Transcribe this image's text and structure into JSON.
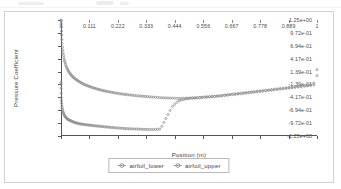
{
  "chart_data": {
    "type": "scatter",
    "title": "",
    "xlabel": "Position (m)",
    "ylabel": "Pressure Coefficient",
    "xlim": [
      0,
      1
    ],
    "ylim": [
      -1.25,
      1.25
    ],
    "grid": false,
    "legend_position": "bottom-center",
    "xticks": [
      "0",
      "0.111",
      "0.222",
      "0.333",
      "0.444",
      "0.556",
      "0.667",
      "0.778",
      "0.889",
      "1"
    ],
    "xtick_values": [
      0,
      0.111,
      0.222,
      0.333,
      0.444,
      0.556,
      0.667,
      0.778,
      0.889,
      1
    ],
    "yticks": [
      "1.25e+00",
      "9.72e-01",
      "6.94e-01",
      "4.17e-01",
      "1.39e-01",
      "-1.39e-01",
      "-4.17e-01",
      "-6.94e-01",
      "-9.72e-01",
      "-1.25e+00"
    ],
    "ytick_values": [
      1.25,
      0.972,
      0.694,
      0.417,
      0.139,
      -0.139,
      -0.417,
      -0.694,
      -0.972,
      -1.25
    ],
    "series": [
      {
        "name": "airfoil_lower",
        "color": "#8c8c92",
        "marker": "circle-dot",
        "x": [
          0.0,
          0.0005,
          0.0012,
          0.0022,
          0.0035,
          0.005,
          0.007,
          0.009,
          0.012,
          0.015,
          0.019,
          0.024,
          0.03,
          0.037,
          0.045,
          0.054,
          0.064,
          0.075,
          0.088,
          0.102,
          0.117,
          0.133,
          0.15,
          0.168,
          0.187,
          0.207,
          0.228,
          0.25,
          0.272,
          0.295,
          0.318,
          0.341,
          0.364,
          0.388,
          0.411,
          0.434,
          0.457,
          0.48,
          0.503,
          0.526,
          0.549,
          0.572,
          0.595,
          0.618,
          0.641,
          0.664,
          0.687,
          0.71,
          0.733,
          0.756,
          0.779,
          0.802,
          0.825,
          0.848,
          0.871,
          0.894,
          0.917,
          0.94,
          0.963,
          0.982,
          0.993,
          0.998,
          1.0
        ],
        "y": [
          -0.1,
          -0.28,
          -0.42,
          -0.52,
          -0.6,
          -0.66,
          -0.71,
          -0.75,
          -0.79,
          -0.82,
          -0.85,
          -0.88,
          -0.9,
          -0.92,
          -0.94,
          -0.96,
          -0.975,
          -0.99,
          -1.0,
          -1.01,
          -1.02,
          -1.03,
          -1.04,
          -1.05,
          -1.06,
          -1.07,
          -1.08,
          -1.09,
          -1.095,
          -1.1,
          -1.105,
          -1.11,
          -1.11,
          -1.1,
          -0.86,
          -0.62,
          -0.5,
          -0.46,
          -0.44,
          -0.43,
          -0.42,
          -0.41,
          -0.4,
          -0.39,
          -0.375,
          -0.36,
          -0.35,
          -0.335,
          -0.32,
          -0.305,
          -0.29,
          -0.275,
          -0.26,
          -0.245,
          -0.23,
          -0.215,
          -0.2,
          -0.185,
          -0.17,
          -0.155,
          -0.14,
          -0.1,
          0.05
        ]
      },
      {
        "name": "airfoil_upper",
        "color": "#8c8c92",
        "marker": "circle-dot",
        "x": [
          0.0,
          0.0004,
          0.001,
          0.0018,
          0.0028,
          0.004,
          0.0055,
          0.0075,
          0.01,
          0.013,
          0.017,
          0.021,
          0.026,
          0.032,
          0.039,
          0.047,
          0.056,
          0.066,
          0.078,
          0.091,
          0.105,
          0.12,
          0.136,
          0.153,
          0.171,
          0.19,
          0.21,
          0.231,
          0.253,
          0.276,
          0.299,
          0.322,
          0.345,
          0.368,
          0.391,
          0.414,
          0.437,
          0.46,
          0.483,
          0.506,
          0.529,
          0.552,
          0.575,
          0.598,
          0.621,
          0.644,
          0.667,
          0.69,
          0.713,
          0.736,
          0.759,
          0.782,
          0.805,
          0.828,
          0.851,
          0.874,
          0.897,
          0.92,
          0.943,
          0.966,
          0.985,
          0.995,
          1.0
        ],
        "y": [
          1.25,
          1.21,
          1.13,
          1.02,
          0.9,
          0.78,
          0.67,
          0.57,
          0.47,
          0.39,
          0.31,
          0.24,
          0.18,
          0.12,
          0.07,
          0.02,
          -0.02,
          -0.06,
          -0.1,
          -0.14,
          -0.17,
          -0.2,
          -0.23,
          -0.255,
          -0.28,
          -0.3,
          -0.32,
          -0.34,
          -0.355,
          -0.37,
          -0.385,
          -0.395,
          -0.405,
          -0.415,
          -0.425,
          -0.43,
          -0.435,
          -0.44,
          -0.435,
          -0.43,
          -0.425,
          -0.415,
          -0.405,
          -0.395,
          -0.38,
          -0.365,
          -0.35,
          -0.335,
          -0.32,
          -0.305,
          -0.29,
          -0.275,
          -0.26,
          -0.245,
          -0.23,
          -0.215,
          -0.2,
          -0.185,
          -0.17,
          -0.155,
          -0.13,
          -0.05,
          0.18
        ]
      }
    ]
  },
  "axes": {
    "x_title": "Position (m)",
    "y_title": "Pressure Coefficient"
  },
  "legend": {
    "entries": [
      {
        "label": "airfoil_lower"
      },
      {
        "label": "airfoil_upper"
      }
    ]
  }
}
